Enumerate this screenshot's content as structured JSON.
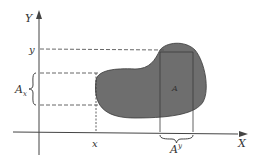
{
  "diagram": {
    "axes": {
      "y_label": "Y",
      "x_label": "X"
    },
    "labels": {
      "y_value": "y",
      "x_value": "x",
      "region": "A",
      "projection_y": "A",
      "projection_y_sub": "x",
      "projection_x": "A",
      "projection_x_sup": "y"
    },
    "colors": {
      "region_fill": "#6e6e6e",
      "line": "#444444",
      "dashed": "#555555"
    }
  }
}
